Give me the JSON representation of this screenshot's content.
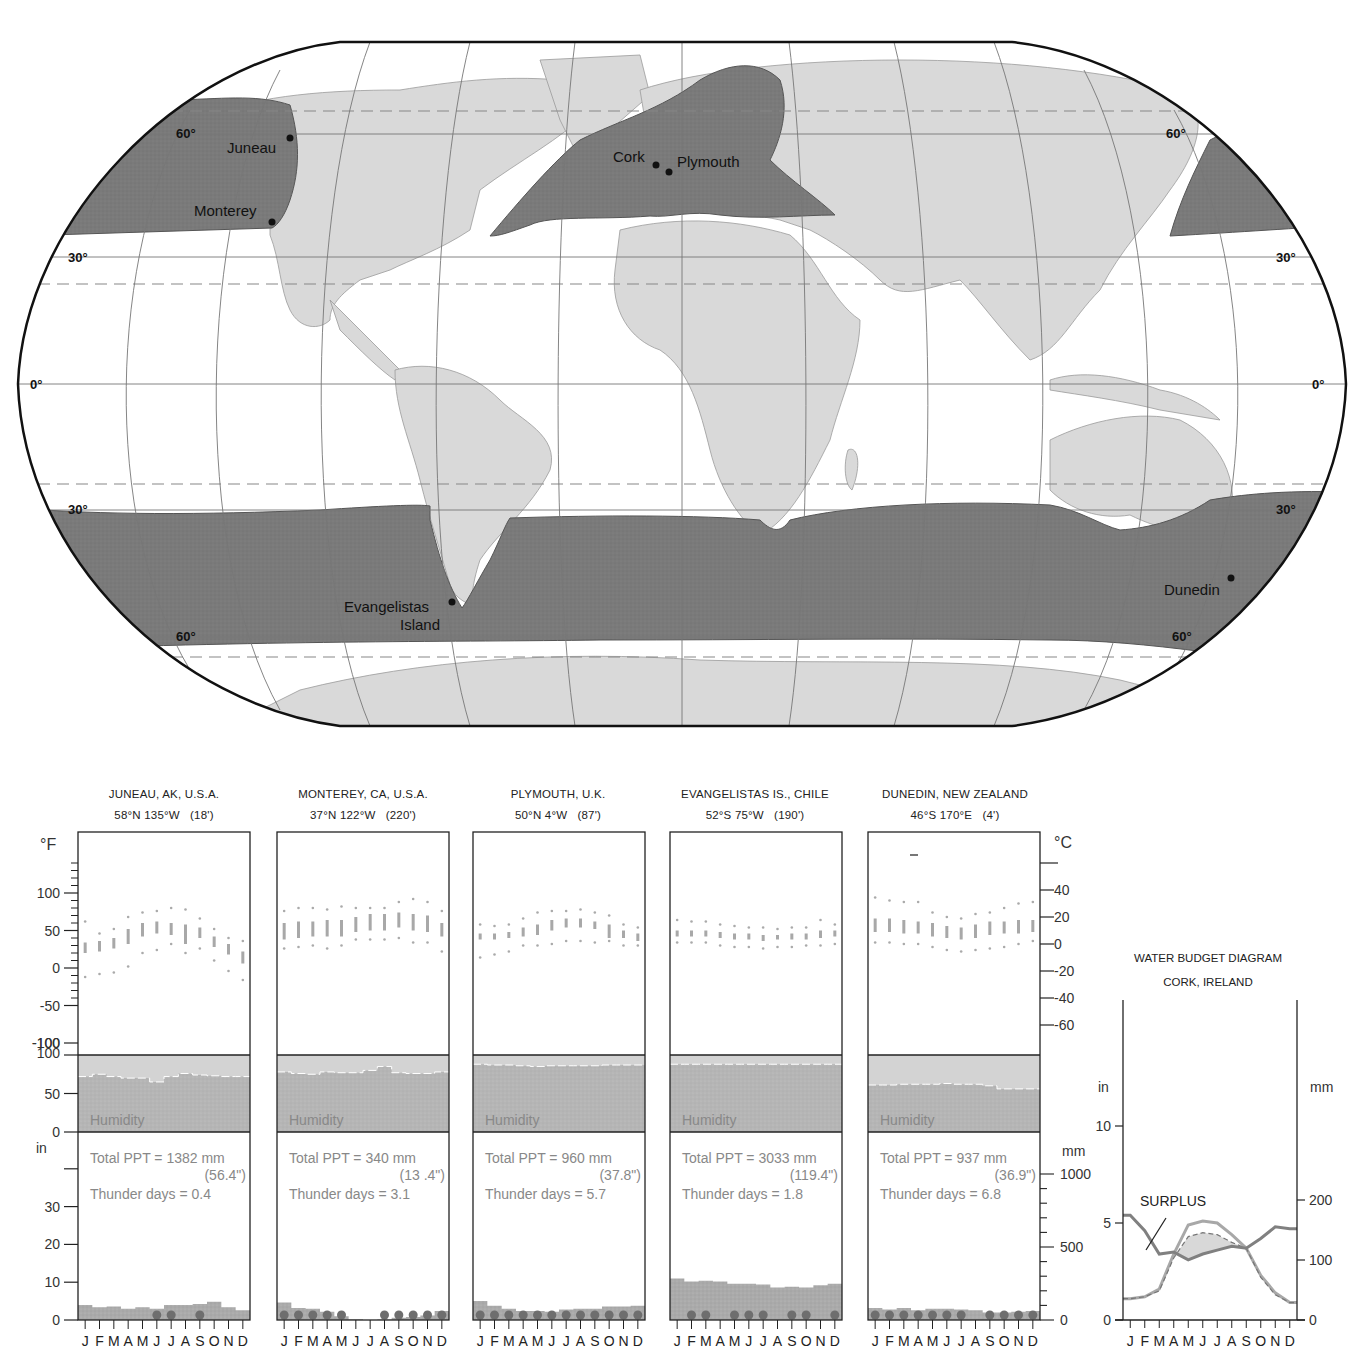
{
  "map": {
    "projection": "Robinson",
    "region_shading": "Marine west coast climate (Cfb)",
    "latitude_labels": {
      "left": [
        "60°",
        "30°",
        "0°",
        "30°",
        "60°"
      ],
      "right": [
        "60°",
        "30°",
        "0°",
        "30°",
        "60°"
      ]
    },
    "cities": [
      {
        "name": "Juneau",
        "x": 290,
        "y": 138
      },
      {
        "name": "Monterey",
        "x": 272,
        "y": 222
      },
      {
        "name": "Cork",
        "x": 656,
        "y": 165
      },
      {
        "name": "Plymouth",
        "x": 669,
        "y": 172
      },
      {
        "name": "Evangelistas",
        "name2": "Island",
        "x": 452,
        "y": 602
      },
      {
        "name": "Dunedin",
        "x": 1231,
        "y": 578
      }
    ],
    "colors": {
      "land": "#d9d9d9",
      "climate_region": "#7d7d7d",
      "ocean": "#ffffff",
      "grid": "#777777",
      "outline": "#111111"
    }
  },
  "stations": [
    {
      "name": "JUNEAU, AK, U.S.A.",
      "coords": "58°N 135°W   (18')",
      "total_ppt": "Total PPT = 1382 mm",
      "total_ppt_in": "(56.4\")",
      "thunder_days": "Thunder days = 0.4"
    },
    {
      "name": "MONTEREY, CA, U.S.A.",
      "coords": "37°N 122°W   (220')",
      "total_ppt": "Total PPT = 340 mm",
      "total_ppt_in": "(13 .4\")",
      "thunder_days": "Thunder days = 3.1"
    },
    {
      "name": "PLYMOUTH, U.K.",
      "coords": "50°N 4°W   (87')",
      "total_ppt": "Total PPT = 960 mm",
      "total_ppt_in": "(37.8\")",
      "thunder_days": "Thunder days = 5.7"
    },
    {
      "name": "EVANGELISTAS IS., CHILE",
      "coords": "52°S 75°W   (190')",
      "total_ppt": "Total PPT = 3033 mm",
      "total_ppt_in": "(119.4\")",
      "thunder_days": "Thunder days = 1.8"
    },
    {
      "name": "DUNEDIN, NEW ZEALAND",
      "coords": "46°S 170°E   (4')",
      "total_ppt": "Total PPT = 937 mm",
      "total_ppt_in": "(36.9\")",
      "thunder_days": "Thunder days = 6.8"
    }
  ],
  "labels": {
    "humidity": "Humidity",
    "deg_f": "°F",
    "deg_c": "°C",
    "inches": "in",
    "mm": "mm",
    "months": "J F M A M J J A S O N D"
  },
  "water_budget": {
    "title": "WATER BUDGET DIAGRAM",
    "subtitle": "CORK, IRELAND",
    "surplus_label": "SURPLUS",
    "in_label": "in",
    "mm_label": "mm"
  },
  "chart_data": [
    {
      "type": "climograph",
      "title": "JUNEAU, AK, U.S.A.",
      "subtitle": "58°N 135°W (18')",
      "categories": [
        "J",
        "F",
        "M",
        "A",
        "M",
        "J",
        "J",
        "A",
        "S",
        "O",
        "N",
        "D"
      ],
      "temperature_F": {
        "record_high": [
          62,
          46,
          52,
          68,
          74,
          76,
          80,
          78,
          66,
          52,
          40,
          36
        ],
        "mean_max": [
          34,
          36,
          40,
          52,
          60,
          62,
          60,
          58,
          54,
          42,
          32,
          22
        ],
        "mean_min": [
          20,
          22,
          26,
          32,
          42,
          46,
          44,
          32,
          40,
          28,
          18,
          6
        ],
        "record_low": [
          -12,
          -8,
          -6,
          2,
          20,
          24,
          32,
          20,
          26,
          10,
          -4,
          -16
        ]
      },
      "humidity_pct": [
        72,
        75,
        72,
        70,
        70,
        65,
        72,
        76,
        74,
        73,
        72,
        72
      ],
      "precip_in": [
        4.0,
        3.4,
        3.6,
        3.0,
        3.4,
        3.0,
        4.0,
        4.0,
        4.2,
        4.8,
        3.4,
        2.6
      ],
      "thunder_days_markers": [
        "J",
        "J",
        "S"
      ],
      "total_ppt_mm": 1382,
      "total_ppt_in": 56.4,
      "thunder_days": 0.4,
      "axes": {
        "temp_F": [
          -100,
          100
        ],
        "temp_C": [
          -60,
          40
        ],
        "humidity": [
          0,
          100
        ],
        "precip_in": [
          0,
          30
        ],
        "precip_mm": [
          0,
          1000
        ]
      }
    },
    {
      "type": "climograph",
      "title": "MONTEREY, CA, U.S.A.",
      "subtitle": "37°N 122°W (220')",
      "categories": [
        "J",
        "F",
        "M",
        "A",
        "M",
        "J",
        "J",
        "A",
        "S",
        "O",
        "N",
        "D"
      ],
      "temperature_F": {
        "record_high": [
          76,
          80,
          80,
          78,
          82,
          80,
          80,
          80,
          88,
          92,
          88,
          76
        ],
        "mean_max": [
          60,
          62,
          62,
          64,
          64,
          68,
          72,
          72,
          74,
          72,
          70,
          60
        ],
        "mean_min": [
          38,
          40,
          42,
          42,
          42,
          48,
          50,
          50,
          54,
          50,
          48,
          42
        ],
        "record_low": [
          26,
          28,
          30,
          26,
          30,
          38,
          38,
          38,
          40,
          34,
          34,
          22
        ]
      },
      "humidity_pct": [
        78,
        76,
        75,
        78,
        77,
        77,
        80,
        85,
        77,
        76,
        76,
        78
      ],
      "precip_in": [
        4.6,
        3.2,
        3.0,
        2.2,
        1.0,
        0.2,
        0.0,
        0.1,
        0.6,
        0.8,
        1.2,
        2.4
      ],
      "thunder_days_markers": [
        "J",
        "F",
        "M",
        "A",
        "M",
        "A",
        "S",
        "O",
        "N",
        "D"
      ],
      "total_ppt_mm": 340,
      "total_ppt_in": 13.4,
      "thunder_days": 3.1
    },
    {
      "type": "climograph",
      "title": "PLYMOUTH, U.K.",
      "subtitle": "50°N 4°W (87')",
      "categories": [
        "J",
        "F",
        "M",
        "A",
        "M",
        "J",
        "J",
        "A",
        "S",
        "O",
        "N",
        "D"
      ],
      "temperature_F": {
        "record_high": [
          58,
          56,
          58,
          66,
          74,
          76,
          76,
          78,
          74,
          70,
          58,
          54
        ],
        "mean_max": [
          46,
          46,
          48,
          54,
          58,
          64,
          66,
          66,
          62,
          58,
          50,
          46
        ],
        "mean_min": [
          38,
          38,
          40,
          42,
          44,
          50,
          54,
          54,
          52,
          40,
          40,
          36
        ],
        "record_low": [
          14,
          18,
          22,
          30,
          30,
          32,
          36,
          36,
          34,
          36,
          30,
          30
        ]
      },
      "humidity_pct": [
        88,
        87,
        87,
        86,
        85,
        86,
        86,
        86,
        86,
        87,
        87,
        87
      ],
      "precip_in": [
        5.0,
        3.8,
        3.0,
        2.4,
        2.4,
        2.2,
        2.8,
        3.0,
        3.0,
        3.6,
        3.6,
        3.8
      ],
      "thunder_days_markers": [
        "J",
        "F",
        "M",
        "A",
        "M",
        "J",
        "J",
        "A",
        "S",
        "O",
        "N",
        "D"
      ],
      "total_ppt_mm": 960,
      "total_ppt_in": 37.8,
      "thunder_days": 5.7
    },
    {
      "type": "climograph",
      "title": "EVANGELISTAS IS., CHILE",
      "subtitle": "52°S 75°W (190')",
      "categories": [
        "J",
        "F",
        "M",
        "A",
        "M",
        "J",
        "J",
        "A",
        "S",
        "O",
        "N",
        "D"
      ],
      "temperature_F": {
        "record_high": [
          64,
          62,
          62,
          58,
          56,
          54,
          54,
          52,
          54,
          54,
          64,
          58
        ],
        "mean_max": [
          50,
          50,
          50,
          48,
          46,
          46,
          44,
          44,
          46,
          46,
          50,
          50
        ],
        "mean_min": [
          42,
          42,
          42,
          40,
          38,
          38,
          36,
          38,
          38,
          38,
          40,
          42
        ],
        "record_low": [
          34,
          34,
          34,
          30,
          28,
          28,
          26,
          28,
          28,
          30,
          30,
          32
        ]
      },
      "humidity_pct": [
        88,
        88,
        88,
        88,
        88,
        88,
        88,
        88,
        88,
        88,
        88,
        88
      ],
      "precip_in": [
        11.0,
        10.2,
        10.4,
        10.2,
        9.6,
        9.6,
        9.4,
        8.6,
        8.8,
        8.6,
        9.2,
        9.6
      ],
      "thunder_days_markers": [
        "F",
        "M",
        "M",
        "J",
        "J",
        "S",
        "O",
        "D"
      ],
      "total_ppt_mm": 3033,
      "total_ppt_in": 119.4,
      "thunder_days": 1.8
    },
    {
      "type": "climograph",
      "title": "DUNEDIN, NEW ZEALAND",
      "subtitle": "46°S 170°E (4')",
      "categories": [
        "J",
        "F",
        "M",
        "A",
        "M",
        "J",
        "J",
        "A",
        "S",
        "O",
        "N",
        "D"
      ],
      "temperature_F": {
        "record_high": [
          94,
          90,
          88,
          88,
          74,
          68,
          66,
          72,
          74,
          80,
          86,
          88
        ],
        "mean_max": [
          66,
          66,
          64,
          62,
          60,
          56,
          54,
          58,
          62,
          62,
          64,
          64
        ],
        "mean_min": [
          48,
          48,
          46,
          46,
          42,
          40,
          38,
          40,
          44,
          46,
          46,
          48
        ],
        "record_low": [
          34,
          34,
          32,
          32,
          28,
          24,
          22,
          24,
          26,
          28,
          32,
          36
        ]
      },
      "humidity_pct": [
        61,
        61,
        62,
        62,
        62,
        63,
        62,
        62,
        60,
        56,
        56,
        56
      ],
      "precip_in": [
        3.2,
        2.8,
        3.2,
        2.6,
        3.0,
        3.0,
        2.8,
        2.6,
        2.0,
        2.0,
        2.2,
        2.4
      ],
      "thunder_days_markers": [
        "J",
        "F",
        "M",
        "A",
        "M",
        "J",
        "J",
        "S",
        "O",
        "N",
        "D"
      ],
      "total_ppt_mm": 937,
      "total_ppt_in": 36.9,
      "thunder_days": 6.8
    },
    {
      "type": "line",
      "title": "WATER BUDGET DIAGRAM",
      "subtitle": "CORK, IRELAND",
      "categories": [
        "J",
        "F",
        "M",
        "A",
        "M",
        "J",
        "J",
        "A",
        "S",
        "O",
        "N",
        "D"
      ],
      "series": [
        {
          "name": "Precipitation (in)",
          "values": [
            5.4,
            4.6,
            3.4,
            3.5,
            3.1,
            3.4,
            3.6,
            3.8,
            3.7,
            4.2,
            4.8,
            4.7
          ]
        },
        {
          "name": "Potential evapotranspiration (in)",
          "values": [
            1.1,
            1.2,
            1.6,
            3.4,
            4.9,
            5.1,
            5.0,
            4.4,
            3.7,
            2.3,
            1.4,
            0.9
          ]
        },
        {
          "name": "Actual evapotranspiration (in)",
          "values": [
            1.1,
            1.2,
            1.5,
            3.2,
            4.3,
            4.5,
            4.4,
            4.0,
            3.7,
            2.2,
            1.3,
            0.9
          ]
        }
      ],
      "annotations": [
        "SURPLUS"
      ],
      "ylabel_left": "in",
      "ylim_left": [
        0,
        15
      ],
      "yticks_left": [
        0,
        5,
        10
      ],
      "ylabel_right": "mm",
      "yticks_right": [
        0,
        100,
        200
      ]
    }
  ]
}
